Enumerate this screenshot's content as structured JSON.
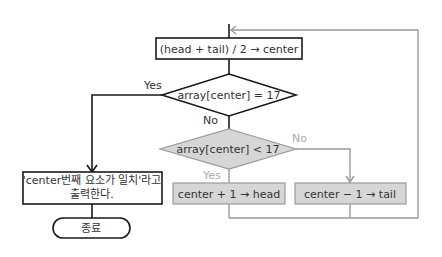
{
  "nodes": {
    "compute_center": "(head + tail) / 2 → center",
    "check_equal": "array[center] = 17",
    "check_less": "array[center] < 17",
    "update_head": "center + 1 → head",
    "update_tail": "center − 1 → tail",
    "output_line1": "'center번째 요소가 일치'라고",
    "output_line2": "출력한다.",
    "end": "종료"
  },
  "edges": {
    "equal_yes": "Yes",
    "equal_no": "No",
    "less_yes": "Yes",
    "less_no": "No"
  },
  "colors": {
    "black_line": "#1a1a1a",
    "gray_line": "#9a9a9a",
    "gray_fill": "#d6d6d6",
    "gray_label": "#aaaaaa"
  }
}
